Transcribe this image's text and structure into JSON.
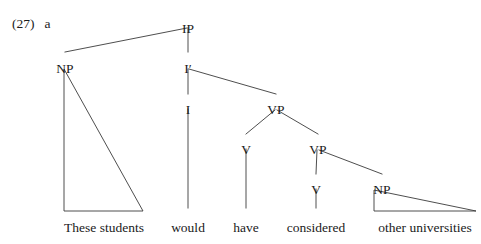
{
  "figure": {
    "example_number": "(27)",
    "sub_label": "a",
    "width": 481,
    "height": 244,
    "background_color": "#ffffff",
    "line_color": "#3a3a3a",
    "text_color": "#1a1a1a"
  },
  "tree": {
    "nodes": [
      {
        "id": "IP",
        "label": "IP",
        "x": 188,
        "y": 22
      },
      {
        "id": "NP1",
        "label": "NP",
        "x": 65,
        "y": 62
      },
      {
        "id": "Ibar",
        "label": "I′",
        "x": 188,
        "y": 62
      },
      {
        "id": "I",
        "label": "I",
        "x": 188,
        "y": 103
      },
      {
        "id": "VP1",
        "label": "VP",
        "x": 276,
        "y": 103
      },
      {
        "id": "V1",
        "label": "V",
        "x": 246,
        "y": 143
      },
      {
        "id": "VP2",
        "label": "VP",
        "x": 318,
        "y": 143
      },
      {
        "id": "V2",
        "label": "V",
        "x": 316,
        "y": 183
      },
      {
        "id": "NP2",
        "label": "NP",
        "x": 382,
        "y": 183
      }
    ],
    "branches": [
      {
        "from": "IP",
        "to": "NP1",
        "x1": 187,
        "y1": 28,
        "x2": 65,
        "y2": 52
      },
      {
        "from": "IP",
        "to": "Ibar",
        "x1": 188,
        "y1": 28,
        "x2": 188,
        "y2": 52
      },
      {
        "from": "Ibar",
        "to": "I",
        "x1": 188,
        "y1": 69,
        "x2": 188,
        "y2": 94
      },
      {
        "from": "Ibar",
        "to": "VP1",
        "x1": 189,
        "y1": 69,
        "x2": 276,
        "y2": 94
      },
      {
        "from": "I",
        "to": "would",
        "x1": 188,
        "y1": 109,
        "x2": 188,
        "y2": 208
      },
      {
        "from": "VP1",
        "to": "V1",
        "x1": 275,
        "y1": 110,
        "x2": 246,
        "y2": 134
      },
      {
        "from": "VP1",
        "to": "VP2",
        "x1": 277,
        "y1": 110,
        "x2": 318,
        "y2": 134
      },
      {
        "from": "V1",
        "to": "have",
        "x1": 246,
        "y1": 149,
        "x2": 246,
        "y2": 208
      },
      {
        "from": "VP2",
        "to": "V2",
        "x1": 317,
        "y1": 150,
        "x2": 316,
        "y2": 174
      },
      {
        "from": "VP2",
        "to": "NP2",
        "x1": 319,
        "y1": 150,
        "x2": 382,
        "y2": 174
      },
      {
        "from": "V2",
        "to": "considered",
        "x1": 316,
        "y1": 189,
        "x2": 316,
        "y2": 208
      }
    ],
    "triangles": [
      {
        "id": "np1-triangle",
        "dominates": "NP1",
        "spans": "These students",
        "apex_x": 64,
        "apex_y": 69,
        "base_left_x": 64,
        "base_right_x": 143,
        "base_y": 211
      },
      {
        "id": "np2-triangle",
        "dominates": "NP2",
        "spans": "other universities",
        "apex_x": 374,
        "apex_y": 190,
        "base_left_x": 374,
        "base_right_x": 476,
        "base_y": 211
      }
    ],
    "leaves": [
      {
        "id": "leaf-these-students",
        "text": "These students",
        "x": 104,
        "y": 221
      },
      {
        "id": "leaf-would",
        "text": "would",
        "x": 188,
        "y": 221
      },
      {
        "id": "leaf-have",
        "text": "have",
        "x": 246,
        "y": 221
      },
      {
        "id": "leaf-considered",
        "text": "considered",
        "x": 316,
        "y": 221
      },
      {
        "id": "leaf-other-universities",
        "text": "other universities",
        "x": 425,
        "y": 221
      }
    ]
  }
}
